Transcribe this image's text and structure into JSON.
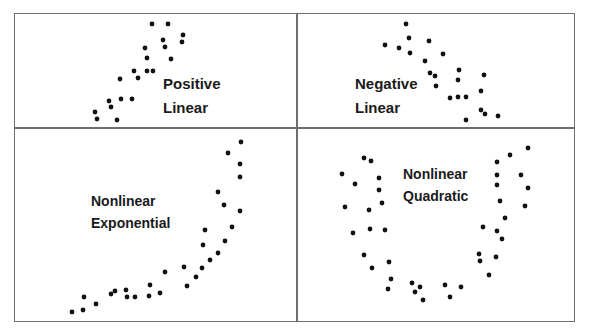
{
  "figure": {
    "line_color": "#6e6e6e",
    "dot_color": "#111111",
    "panels": [
      {
        "id": "positive-linear",
        "label_line1": "Positive",
        "label_line2": "Linear"
      },
      {
        "id": "negative-linear",
        "label_line1": "Negative",
        "label_line2": "Linear"
      },
      {
        "id": "nonlinear-exponential",
        "label_line1": "Nonlinear",
        "label_line2": "Exponential"
      },
      {
        "id": "nonlinear-quadratic",
        "label_line1": "Nonlinear",
        "label_line2": "Quadratic"
      }
    ]
  },
  "chart_data": [
    {
      "type": "scatter",
      "title": "Positive Linear",
      "xlabel": "",
      "ylabel": "",
      "grid": false,
      "points_px": [
        [
          152,
          24
        ],
        [
          168,
          24
        ],
        [
          183,
          35
        ],
        [
          182,
          42
        ],
        [
          163,
          40
        ],
        [
          165,
          47
        ],
        [
          145,
          48
        ],
        [
          147,
          58
        ],
        [
          171,
          59
        ],
        [
          134,
          71
        ],
        [
          147,
          71
        ],
        [
          153,
          71
        ],
        [
          120,
          79
        ],
        [
          138,
          78
        ],
        [
          121,
          99
        ],
        [
          132,
          99
        ],
        [
          109,
          101
        ],
        [
          111,
          107
        ],
        [
          95,
          112
        ],
        [
          97,
          119
        ],
        [
          117,
          120
        ]
      ]
    },
    {
      "type": "scatter",
      "title": "Negative Linear",
      "xlabel": "",
      "ylabel": "",
      "grid": false,
      "points_px": [
        [
          406,
          24
        ],
        [
          409,
          38
        ],
        [
          429,
          41
        ],
        [
          385,
          45
        ],
        [
          399,
          48
        ],
        [
          410,
          53
        ],
        [
          443,
          54
        ],
        [
          425,
          61
        ],
        [
          459,
          70
        ],
        [
          430,
          73
        ],
        [
          435,
          76
        ],
        [
          458,
          80
        ],
        [
          484,
          75
        ],
        [
          436,
          86
        ],
        [
          481,
          91
        ],
        [
          450,
          98
        ],
        [
          458,
          97
        ],
        [
          466,
          97
        ],
        [
          481,
          110
        ],
        [
          485,
          114
        ],
        [
          498,
          116
        ],
        [
          466,
          120
        ]
      ]
    },
    {
      "type": "scatter",
      "title": "Nonlinear Exponential",
      "xlabel": "",
      "ylabel": "",
      "grid": false,
      "points_px": [
        [
          241,
          142
        ],
        [
          228,
          153
        ],
        [
          240,
          164
        ],
        [
          240,
          177
        ],
        [
          218,
          192
        ],
        [
          224,
          205
        ],
        [
          240,
          211
        ],
        [
          232,
          227
        ],
        [
          205,
          230
        ],
        [
          225,
          241
        ],
        [
          203,
          245
        ],
        [
          218,
          253
        ],
        [
          210,
          260
        ],
        [
          184,
          267
        ],
        [
          202,
          268
        ],
        [
          165,
          272
        ],
        [
          196,
          277
        ],
        [
          150,
          285
        ],
        [
          187,
          286
        ],
        [
          126,
          290
        ],
        [
          115,
          291
        ],
        [
          111,
          294
        ],
        [
          160,
          293
        ],
        [
          149,
          296
        ],
        [
          127,
          297
        ],
        [
          135,
          297
        ],
        [
          84,
          297
        ],
        [
          96,
          304
        ],
        [
          83,
          310
        ],
        [
          72,
          312
        ]
      ]
    },
    {
      "type": "scatter",
      "title": "Nonlinear Quadratic",
      "xlabel": "",
      "ylabel": "",
      "grid": false,
      "points_px": [
        [
          528,
          148
        ],
        [
          510,
          155
        ],
        [
          364,
          158
        ],
        [
          371,
          161
        ],
        [
          497,
          162
        ],
        [
          342,
          174
        ],
        [
          497,
          175
        ],
        [
          521,
          175
        ],
        [
          379,
          178
        ],
        [
          355,
          184
        ],
        [
          497,
          185
        ],
        [
          379,
          190
        ],
        [
          528,
          188
        ],
        [
          382,
          203
        ],
        [
          500,
          201
        ],
        [
          345,
          207
        ],
        [
          369,
          210
        ],
        [
          525,
          206
        ],
        [
          505,
          218
        ],
        [
          483,
          227
        ],
        [
          370,
          229
        ],
        [
          385,
          230
        ],
        [
          497,
          231
        ],
        [
          353,
          233
        ],
        [
          502,
          239
        ],
        [
          479,
          254
        ],
        [
          364,
          255
        ],
        [
          496,
          257
        ],
        [
          480,
          261
        ],
        [
          389,
          262
        ],
        [
          372,
          268
        ],
        [
          489,
          275
        ],
        [
          391,
          279
        ],
        [
          412,
          283
        ],
        [
          445,
          285
        ],
        [
          461,
          287
        ],
        [
          420,
          287
        ],
        [
          388,
          289
        ],
        [
          415,
          292
        ],
        [
          450,
          297
        ],
        [
          423,
          300
        ]
      ]
    }
  ]
}
